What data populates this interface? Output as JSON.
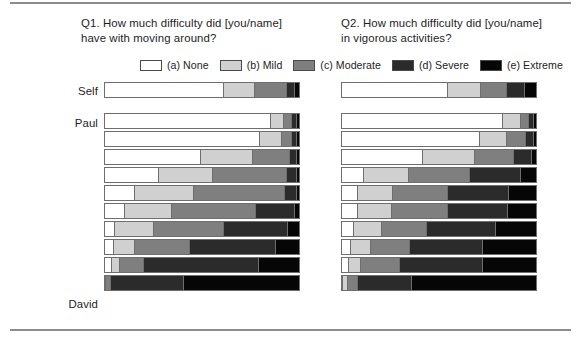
{
  "figure": {
    "rule_color": "#8c8c8c"
  },
  "headings": {
    "q1": "Q1. How much difficulty did [you/name]\nhave with moving around?",
    "q2": "Q2. How much difficulty did [you/name]\nin vigorous activities?"
  },
  "legend": {
    "items": [
      {
        "label": "(a) None",
        "color": "#ffffff"
      },
      {
        "label": "(b) Mild",
        "color": "#d0d0d0"
      },
      {
        "label": "(c) Moderate",
        "color": "#7f7f7f"
      },
      {
        "label": "(d) Severe",
        "color": "#2b2b2b"
      },
      {
        "label": "(e) Extreme",
        "color": "#060606"
      }
    ]
  },
  "row_labels": {
    "self": "Self",
    "paul": "Paul",
    "david": "David"
  },
  "chart_data": [
    {
      "type": "bar",
      "subtype": "stacked-horizontal-100pct",
      "title": "Q1. How much difficulty did [you/name] have with moving around?",
      "xlabel": "",
      "ylabel": "",
      "xlim": [
        0,
        100
      ],
      "grid": false,
      "legend_position": "top",
      "orientation": "horizontal",
      "stacked": true,
      "categories": [
        "(a) None",
        "(b) Mild",
        "(c) Moderate",
        "(d) Severe",
        "(e) Extreme"
      ],
      "colors": [
        "#ffffff",
        "#d0d0d0",
        "#7f7f7f",
        "#2b2b2b",
        "#060606"
      ],
      "groups": [
        {
          "name": "Self",
          "rows": [
            {
              "label": "Self",
              "values": [
                62,
                16,
                16,
                4,
                2
              ]
            }
          ]
        },
        {
          "name": "Paul-to-David",
          "first_label": "Paul",
          "last_label": "David",
          "rows": [
            {
              "label": "Paul",
              "values": [
                87,
                6,
                4,
                2,
                1
              ]
            },
            {
              "label": "",
              "values": [
                81,
                11,
                5,
                2,
                1
              ]
            },
            {
              "label": "",
              "values": [
                50,
                27,
                19,
                3,
                1
              ]
            },
            {
              "label": "",
              "values": [
                28,
                28,
                38,
                5,
                1
              ]
            },
            {
              "label": "",
              "values": [
                15,
                31,
                47,
                6,
                1
              ]
            },
            {
              "label": "",
              "values": [
                10,
                24,
                44,
                20,
                2
              ]
            },
            {
              "label": "",
              "values": [
                5,
                20,
                36,
                33,
                6
              ]
            },
            {
              "label": "",
              "values": [
                4,
                11,
                28,
                45,
                12
              ]
            },
            {
              "label": "",
              "values": [
                3,
                4,
                12,
                60,
                21
              ]
            },
            {
              "label": "David",
              "values": [
                0,
                0,
                2,
                38,
                60
              ]
            }
          ]
        }
      ]
    },
    {
      "type": "bar",
      "subtype": "stacked-horizontal-100pct",
      "title": "Q2. How much difficulty did [you/name] in vigorous activities?",
      "xlabel": "",
      "ylabel": "",
      "xlim": [
        0,
        100
      ],
      "grid": false,
      "legend_position": "top",
      "orientation": "horizontal",
      "stacked": true,
      "categories": [
        "(a) None",
        "(b) Mild",
        "(c) Moderate",
        "(d) Severe",
        "(e) Extreme"
      ],
      "colors": [
        "#ffffff",
        "#d0d0d0",
        "#7f7f7f",
        "#2b2b2b",
        "#060606"
      ],
      "groups": [
        {
          "name": "Self",
          "rows": [
            {
              "label": "Self",
              "values": [
                55,
                17,
                13,
                9,
                6
              ]
            }
          ]
        },
        {
          "name": "Paul-to-David",
          "first_label": "Paul",
          "last_label": "David",
          "rows": [
            {
              "label": "Paul",
              "values": [
                84,
                9,
                4,
                2,
                1
              ]
            },
            {
              "label": "",
              "values": [
                72,
                14,
                9,
                4,
                1
              ]
            },
            {
              "label": "",
              "values": [
                42,
                27,
                20,
                9,
                2
              ]
            },
            {
              "label": "",
              "values": [
                11,
                23,
                32,
                26,
                8
              ]
            },
            {
              "label": "",
              "values": [
                8,
                18,
                28,
                32,
                14
              ]
            },
            {
              "label": "",
              "values": [
                8,
                17,
                29,
                31,
                15
              ]
            },
            {
              "label": "",
              "values": [
                6,
                14,
                23,
                36,
                21
              ]
            },
            {
              "label": "",
              "values": [
                4,
                10,
                20,
                38,
                28
              ]
            },
            {
              "label": "",
              "values": [
                3,
                6,
                20,
                43,
                28
              ]
            },
            {
              "label": "David",
              "values": [
                0,
                2,
                5,
                28,
                65
              ]
            }
          ]
        }
      ]
    }
  ]
}
